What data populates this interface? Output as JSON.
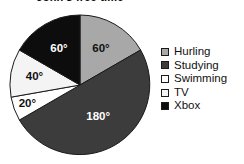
{
  "chart_data": {
    "type": "pie",
    "title": "John's free time",
    "title_cropped": true,
    "units": "degrees",
    "total_degrees": 360,
    "start_angle_deg": 0,
    "direction": "clockwise",
    "grid": false,
    "legend_position": "right",
    "xlabel": "",
    "ylabel": "",
    "categories": [
      "Hurling",
      "Studying",
      "Swimming",
      "TV",
      "Xbox"
    ],
    "values": [
      60,
      180,
      20,
      40,
      60
    ],
    "labels": [
      "60°",
      "180°",
      "20°",
      "40°",
      "60°"
    ],
    "colors": [
      "#a8a8a8",
      "#3c3c3c",
      "#ffffff",
      "#f4f4f4",
      "#0d0d0d"
    ],
    "label_colors": [
      "#111111",
      "#ffffff",
      "#111111",
      "#111111",
      "#ffffff"
    ],
    "slices": [
      {
        "name": "Hurling",
        "value": 60,
        "label": "60°",
        "color": "#a8a8a8",
        "label_color": "#111111",
        "start": 0,
        "end": 60
      },
      {
        "name": "Studying",
        "value": 180,
        "label": "180°",
        "color": "#3c3c3c",
        "label_color": "#ffffff",
        "start": 60,
        "end": 240
      },
      {
        "name": "Swimming",
        "value": 20,
        "label": "20°",
        "color": "#ffffff",
        "label_color": "#111111",
        "start": 240,
        "end": 260
      },
      {
        "name": "TV",
        "value": 40,
        "label": "40°",
        "color": "#f4f4f4",
        "label_color": "#111111",
        "start": 260,
        "end": 300
      },
      {
        "name": "Xbox",
        "value": 60,
        "label": "60°",
        "color": "#0d0d0d",
        "label_color": "#ffffff",
        "start": 300,
        "end": 360
      }
    ]
  },
  "legend": {
    "items": [
      {
        "label": "Hurling",
        "color": "#a8a8a8"
      },
      {
        "label": "Studying",
        "color": "#3c3c3c"
      },
      {
        "label": "Swimming",
        "color": "#ffffff"
      },
      {
        "label": "TV",
        "color": "#f4f4f4"
      },
      {
        "label": "Xbox",
        "color": "#0d0d0d"
      }
    ]
  },
  "style": {
    "outline_color": "#1a1a1a",
    "background": "#ffffff"
  }
}
